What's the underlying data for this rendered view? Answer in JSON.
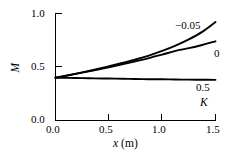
{
  "chart_data": {
    "type": "line",
    "title": "",
    "xlabel": "x (m)",
    "ylabel": "M",
    "xlim": [
      0.0,
      1.5
    ],
    "ylim": [
      0.0,
      1.0
    ],
    "xticks": [
      "0.0",
      "0.5",
      "1.0",
      "1.5"
    ],
    "xtick_values": [
      0.0,
      0.5,
      1.0,
      1.5
    ],
    "yticks": [
      "0.0",
      "0.5",
      "1.0"
    ],
    "ytick_values": [
      0.0,
      0.5,
      1.0
    ],
    "grid": false,
    "legend_position": "right-inline",
    "legend_title": "K",
    "x": [
      0.0,
      0.125,
      0.25,
      0.375,
      0.5,
      0.625,
      0.75,
      0.875,
      1.0,
      1.125,
      1.25,
      1.375,
      1.5
    ],
    "series": [
      {
        "name": "-0.05",
        "label": "−0.05",
        "values": [
          0.4,
          0.424,
          0.45,
          0.477,
          0.506,
          0.537,
          0.57,
          0.607,
          0.65,
          0.7,
          0.758,
          0.828,
          0.92
        ]
      },
      {
        "name": "0",
        "label": "0",
        "values": [
          0.4,
          0.423,
          0.447,
          0.472,
          0.498,
          0.525,
          0.553,
          0.583,
          0.616,
          0.65,
          0.676,
          0.706,
          0.74
        ]
      },
      {
        "name": "0.5",
        "label": "0.5",
        "values": [
          0.4,
          0.398,
          0.396,
          0.394,
          0.392,
          0.39,
          0.388,
          0.386,
          0.385,
          0.383,
          0.382,
          0.381,
          0.38
        ]
      }
    ]
  },
  "labels": {
    "ylabel_text": "M",
    "xlabel_var": "x",
    "xlabel_unit": "(m)",
    "legend_key": "K",
    "curve_top": "−0.05",
    "curve_mid": "0",
    "curve_bottom": "0.5",
    "ytick_0": "0.0",
    "ytick_1": "0.5",
    "ytick_2": "1.0",
    "xtick_0": "0.0",
    "xtick_1": "0.5",
    "xtick_2": "1.0",
    "xtick_3": "1.5"
  },
  "colors": {
    "axis": "#000000",
    "curve": "#000000",
    "background": "#ffffff"
  }
}
